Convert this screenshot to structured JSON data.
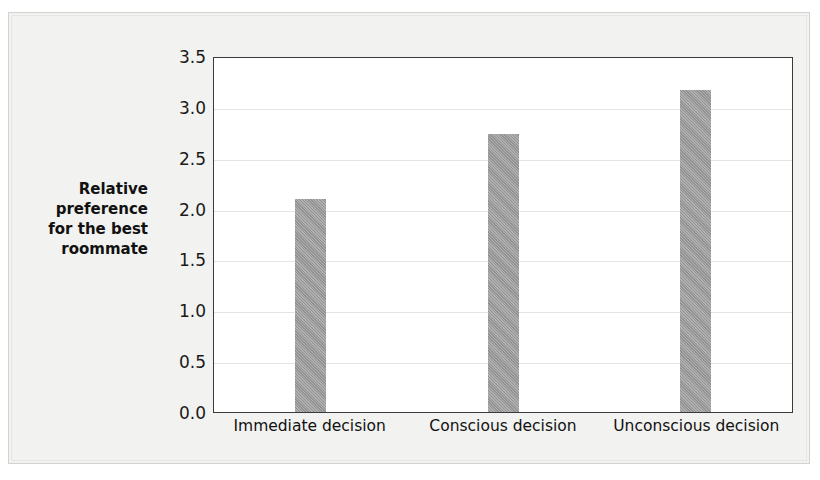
{
  "chart_data": {
    "type": "bar",
    "title": "",
    "xlabel": "",
    "ylabel": "Relative\npreference\nfor the best\nroommate",
    "categories": [
      "Immediate decision",
      "Conscious decision",
      "Unconscious decision"
    ],
    "values": [
      2.09,
      2.73,
      3.17
    ],
    "ylim": [
      0.0,
      3.5
    ],
    "yticks": [
      "0.0",
      "0.5",
      "1.0",
      "1.5",
      "2.0",
      "2.5",
      "3.0",
      "3.5"
    ],
    "ytick_values": [
      0.0,
      0.5,
      1.0,
      1.5,
      2.0,
      2.5,
      3.0,
      3.5
    ],
    "grid": true,
    "legend": false,
    "bar_color": "#9a9a9a",
    "plot_background": "#ffffff",
    "frame_color": "#3a3a3a",
    "gridline_color": "#e4e4e4",
    "page_background": "#f2f2f0"
  }
}
